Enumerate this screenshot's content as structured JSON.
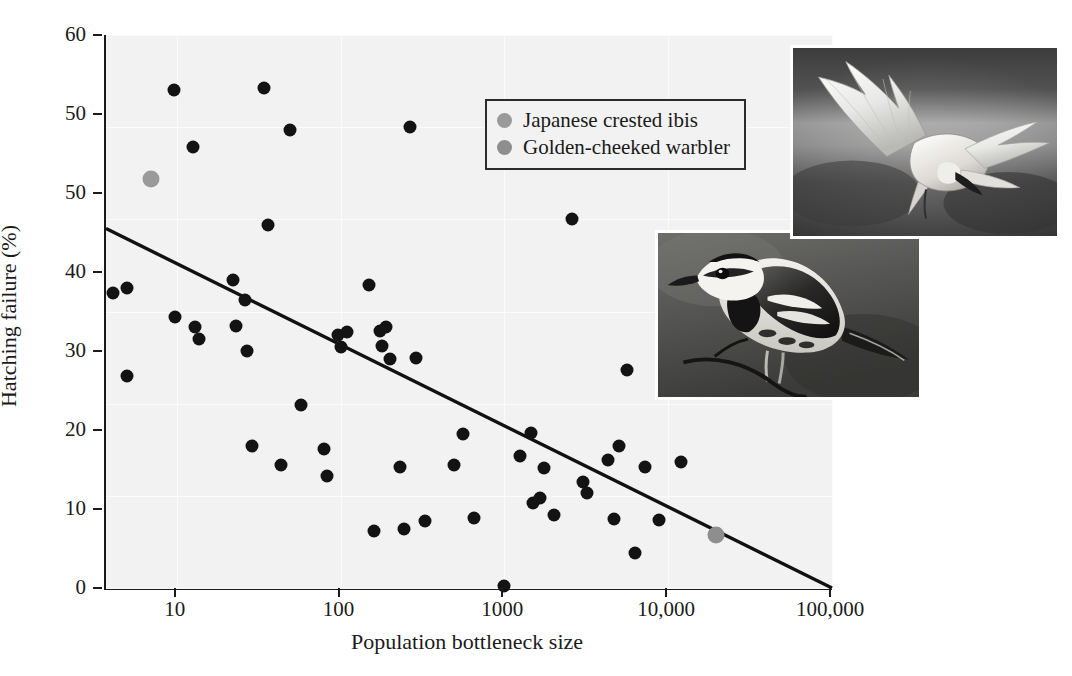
{
  "figure": {
    "background": "#ffffff",
    "plot_background": "#f2f2f2",
    "axis_color": "#1a1a1a"
  },
  "chart_data": {
    "type": "scatter",
    "title": "",
    "xlabel": "Population bottleneck size",
    "ylabel": "Hatching failure (%)",
    "xscale": "log",
    "xlim": [
      3.7,
      100000
    ],
    "ylim": [
      0,
      60
    ],
    "grid": true,
    "xticks": [
      10,
      100,
      1000,
      10000,
      100000
    ],
    "xtick_labels": [
      "10",
      "100",
      "1000",
      "10,000",
      "100,000"
    ],
    "yticks": [
      0,
      10,
      20,
      30,
      40,
      50,
      60
    ],
    "ytick_labels": [
      "0",
      "10",
      "20",
      "30",
      "40",
      "50",
      "50",
      "60"
    ],
    "ytick_values": [
      0,
      10,
      20,
      30,
      40,
      50,
      50,
      60
    ],
    "legend_position": "upper-center",
    "series": [
      {
        "name": "Other species",
        "color": "#131313",
        "marker": "circle",
        "in_legend": false,
        "points": [
          {
            "x": 4.1,
            "y": 32.0
          },
          {
            "x": 5.0,
            "y": 32.5
          },
          {
            "x": 5.0,
            "y": 23.0
          },
          {
            "x": 9.6,
            "y": 54.0
          },
          {
            "x": 9.8,
            "y": 29.4
          },
          {
            "x": 12.5,
            "y": 47.8
          },
          {
            "x": 13.0,
            "y": 28.3
          },
          {
            "x": 13.6,
            "y": 27.0
          },
          {
            "x": 22.0,
            "y": 33.4
          },
          {
            "x": 23.0,
            "y": 28.4
          },
          {
            "x": 26.0,
            "y": 31.2
          },
          {
            "x": 27.0,
            "y": 25.7
          },
          {
            "x": 29.0,
            "y": 15.4
          },
          {
            "x": 34.0,
            "y": 54.3
          },
          {
            "x": 36.0,
            "y": 39.4
          },
          {
            "x": 43.0,
            "y": 13.3
          },
          {
            "x": 49.0,
            "y": 49.7
          },
          {
            "x": 57.0,
            "y": 19.9
          },
          {
            "x": 79.0,
            "y": 15.1
          },
          {
            "x": 83.0,
            "y": 12.2
          },
          {
            "x": 96.0,
            "y": 27.4
          },
          {
            "x": 100.0,
            "y": 26.2
          },
          {
            "x": 110.0,
            "y": 27.8
          },
          {
            "x": 150.0,
            "y": 32.9
          },
          {
            "x": 160.0,
            "y": 6.2
          },
          {
            "x": 175.0,
            "y": 27.9
          },
          {
            "x": 180.0,
            "y": 26.3
          },
          {
            "x": 190.0,
            "y": 28.3
          },
          {
            "x": 200.0,
            "y": 24.8
          },
          {
            "x": 230.0,
            "y": 13.1
          },
          {
            "x": 245.0,
            "y": 6.4
          },
          {
            "x": 265.0,
            "y": 50.0
          },
          {
            "x": 290.0,
            "y": 25.0
          },
          {
            "x": 330.0,
            "y": 7.3
          },
          {
            "x": 490.0,
            "y": 13.3
          },
          {
            "x": 560.0,
            "y": 16.7
          },
          {
            "x": 650.0,
            "y": 7.6
          },
          {
            "x": 990.0,
            "y": 0.2
          },
          {
            "x": 1250.0,
            "y": 14.3
          },
          {
            "x": 1450.0,
            "y": 16.8
          },
          {
            "x": 1500.0,
            "y": 9.2
          },
          {
            "x": 1650.0,
            "y": 9.8
          },
          {
            "x": 1750.0,
            "y": 13.0
          },
          {
            "x": 2000.0,
            "y": 7.9
          },
          {
            "x": 2600.0,
            "y": 40.0
          },
          {
            "x": 3000.0,
            "y": 11.5
          },
          {
            "x": 3200.0,
            "y": 10.3
          },
          {
            "x": 4300.0,
            "y": 13.9
          },
          {
            "x": 4700.0,
            "y": 7.5
          },
          {
            "x": 5000.0,
            "y": 15.4
          },
          {
            "x": 5600.0,
            "y": 23.6
          },
          {
            "x": 6300.0,
            "y": 3.8
          },
          {
            "x": 7200.0,
            "y": 13.1
          },
          {
            "x": 8800.0,
            "y": 7.4
          },
          {
            "x": 12000.0,
            "y": 13.7
          }
        ]
      },
      {
        "name": "Japanese crested ibis",
        "color": "#9a9a9a",
        "marker": "circle",
        "in_legend": true,
        "points": [
          {
            "x": 7.0,
            "y": 44.4
          }
        ]
      },
      {
        "name": "Golden-cheeked warbler",
        "color": "#8e8e8e",
        "marker": "circle",
        "in_legend": true,
        "points": [
          {
            "x": 19500.0,
            "y": 5.8
          }
        ]
      }
    ],
    "trendline": {
      "type": "linear-on-log-x",
      "color": "#111111",
      "start": {
        "x": 3.7,
        "y": 39.0
      },
      "end": {
        "x": 100000,
        "y": 0.0
      }
    },
    "annotations": [
      {
        "name": "photo-ibis",
        "caption": "Japanese crested ibis in flight"
      },
      {
        "name": "photo-warbler",
        "caption": "Golden-cheeked warbler perched"
      }
    ]
  },
  "legend": {
    "entries": [
      {
        "label": "Japanese crested ibis",
        "color": "#9a9a9a"
      },
      {
        "label": "Golden-cheeked warbler",
        "color": "#8e8e8e"
      }
    ]
  }
}
